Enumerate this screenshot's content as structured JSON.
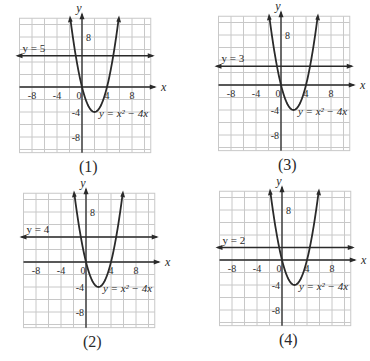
{
  "figure": {
    "panels": [
      {
        "id": "1",
        "caption": "(1)",
        "line_label": "y = 5",
        "line_y": 5,
        "curve_label": "y = x² − 4x",
        "left": 0,
        "top": 0,
        "grid_x": 19,
        "grid_y": 19,
        "origin_x": 82,
        "origin_y": 87
      },
      {
        "id": "3",
        "caption": "(3)",
        "line_label": "y = 3",
        "line_y": 3,
        "curve_label": "y = x² − 4x",
        "left": 185,
        "top": 0,
        "grid_x": 31,
        "grid_y": 19,
        "origin_x": 96,
        "origin_y": 85
      },
      {
        "id": "2",
        "caption": "(2)",
        "line_label": "y = 4",
        "line_y": 4,
        "curve_label": "y = x² − 4x",
        "left": 0,
        "top": 180,
        "grid_x": 21,
        "grid_y": 14,
        "origin_x": 86,
        "origin_y": 82
      },
      {
        "id": "4",
        "caption": "(4)",
        "line_label": "y = 2",
        "line_y": 2,
        "curve_label": "y = x² − 4x",
        "left": 185,
        "top": 180,
        "grid_x": 32,
        "grid_y": 14,
        "origin_x": 97,
        "origin_y": 80
      }
    ],
    "axis": {
      "x_label": "x",
      "y_label": "y",
      "x_ticks": [
        "-8",
        "-4",
        "0",
        "4",
        "8"
      ],
      "y_ticks": [
        "8",
        "-4",
        "-8"
      ]
    },
    "colors": {
      "ink": "#2a2a2a",
      "grid": "#c8c8c8"
    }
  },
  "chart_data": [
    {
      "type": "line",
      "title": "(1)",
      "xlabel": "x",
      "ylabel": "y",
      "xlim": [
        -10,
        11
      ],
      "ylim": [
        -10,
        11
      ],
      "grid": true,
      "series": [
        {
          "name": "y = x^2 - 4x",
          "expr": "x^2-4x"
        },
        {
          "name": "y = 5",
          "expr": "5"
        }
      ]
    },
    {
      "type": "line",
      "title": "(2)",
      "xlabel": "x",
      "ylabel": "y",
      "xlim": [
        -10,
        11
      ],
      "ylim": [
        -10,
        11
      ],
      "grid": true,
      "series": [
        {
          "name": "y = x^2 - 4x",
          "expr": "x^2-4x"
        },
        {
          "name": "y = 4",
          "expr": "4"
        }
      ]
    },
    {
      "type": "line",
      "title": "(3)",
      "xlabel": "x",
      "ylabel": "y",
      "xlim": [
        -10,
        11
      ],
      "ylim": [
        -10,
        11
      ],
      "grid": true,
      "series": [
        {
          "name": "y = x^2 - 4x",
          "expr": "x^2-4x"
        },
        {
          "name": "y = 3",
          "expr": "3"
        }
      ]
    },
    {
      "type": "line",
      "title": "(4)",
      "xlabel": "x",
      "ylabel": "y",
      "xlim": [
        -10,
        11
      ],
      "ylim": [
        -10,
        11
      ],
      "grid": true,
      "series": [
        {
          "name": "y = x^2 - 4x",
          "expr": "x^2-4x"
        },
        {
          "name": "y = 2",
          "expr": "2"
        }
      ]
    }
  ]
}
